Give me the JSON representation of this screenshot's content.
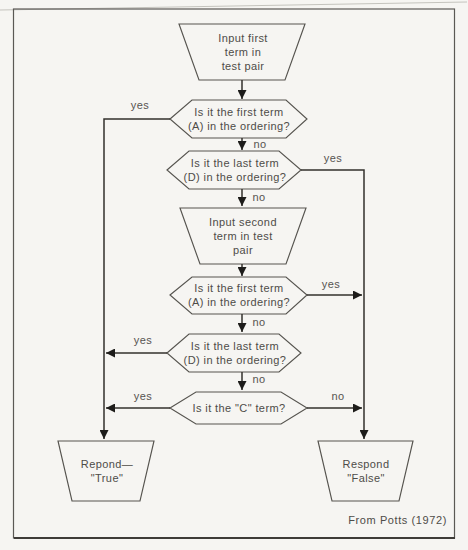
{
  "figure": {
    "caption": "From Potts (1972)",
    "background": "#f6f5f2",
    "ink": "#33312d",
    "shape_outline": "#56544f",
    "frame_color": "#5b5955"
  },
  "nodes": {
    "input_first": {
      "type": "input-trapezoid",
      "label": "Input first\nterm in\ntest pair"
    },
    "decision_first_term_1": {
      "type": "decision-hexagon",
      "label": "Is it the first term\n(A) in the ordering?"
    },
    "decision_last_term_1": {
      "type": "decision-hexagon",
      "label": "Is it the last term\n(D) in the ordering?"
    },
    "input_second": {
      "type": "input-trapezoid",
      "label": "Input second\nterm in test\npair"
    },
    "decision_first_term_2": {
      "type": "decision-hexagon",
      "label": "Is it the first term\n(A) in the ordering?"
    },
    "decision_last_term_2": {
      "type": "decision-hexagon",
      "label": "Is it the last term\n(D) in the ordering?"
    },
    "decision_c_term": {
      "type": "decision-hexagon",
      "label": "Is it the \"C\" term?"
    },
    "respond_true": {
      "type": "output-trapezoid",
      "label": "Repond—\n\"True\""
    },
    "respond_false": {
      "type": "output-trapezoid",
      "label": "Respond\n\"False\""
    }
  },
  "edge_labels": {
    "d1_yes": "yes",
    "d1_no": "no",
    "d2_yes": "yes",
    "d2_no": "no",
    "d3_yes": "yes",
    "d3_no": "no",
    "d4_yes": "yes",
    "d4_no": "no",
    "d5_yes": "yes",
    "d5_no": "no"
  }
}
